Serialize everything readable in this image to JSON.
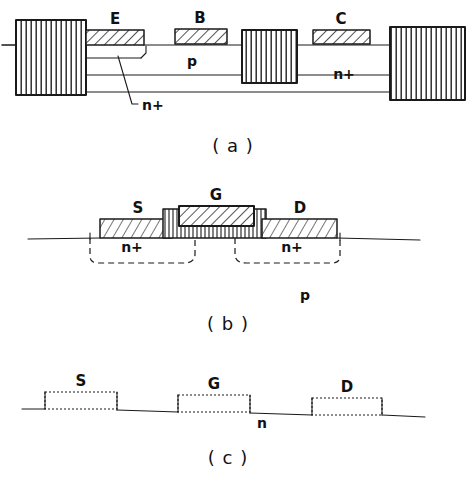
{
  "figure": {
    "background_color": "#ffffff",
    "ink_color": "#1a1a1a"
  },
  "panels": [
    {
      "id": "a",
      "caption": "( a )",
      "description": "Lateral bipolar transistor cross-section with emitter, base and collector contacts",
      "contacts": [
        {
          "name": "emitter-contact",
          "label": "E",
          "fill": "diagonal-hatch"
        },
        {
          "name": "base-contact",
          "label": "B",
          "fill": "diagonal-hatch"
        },
        {
          "name": "collector-contact",
          "label": "C",
          "fill": "diagonal-hatch"
        }
      ],
      "region_labels": [
        {
          "name": "base-region-label",
          "label": "p"
        },
        {
          "name": "collector-region-label",
          "label": "n+"
        },
        {
          "name": "emitter-region-label",
          "label": "n+"
        }
      ],
      "blocks": [
        {
          "name": "left-isolation-block",
          "fill": "vertical-line-hatch"
        },
        {
          "name": "middle-isolation-block",
          "fill": "vertical-line-hatch"
        },
        {
          "name": "right-isolation-block",
          "fill": "vertical-line-hatch"
        }
      ]
    },
    {
      "id": "b",
      "caption": "( b )",
      "description": "Enhancement MOSFET cross-section with source, gate and drain on p substrate",
      "contacts": [
        {
          "name": "source-contact",
          "label": "S",
          "fill": "diagonal-hatch"
        },
        {
          "name": "gate-contact",
          "label": "G",
          "fill": "diagonal-hatch"
        },
        {
          "name": "drain-contact",
          "label": "D",
          "fill": "diagonal-hatch"
        }
      ],
      "region_labels": [
        {
          "name": "source-well-label",
          "label": "n+"
        },
        {
          "name": "drain-well-label",
          "label": "n+"
        },
        {
          "name": "substrate-label",
          "label": "p"
        }
      ],
      "oxide": {
        "name": "gate-oxide-layer",
        "fill": "vertical-line-hatch"
      }
    },
    {
      "id": "c",
      "caption": "( c )",
      "description": "Depletion MOSFET cross-section with source, gate and drain on n substrate",
      "contacts": [
        {
          "name": "source-contact",
          "label": "S",
          "fill": "outline"
        },
        {
          "name": "gate-contact",
          "label": "G",
          "fill": "outline"
        },
        {
          "name": "drain-contact",
          "label": "D",
          "fill": "outline"
        }
      ],
      "region_labels": [
        {
          "name": "substrate-label",
          "label": "n"
        }
      ]
    }
  ]
}
